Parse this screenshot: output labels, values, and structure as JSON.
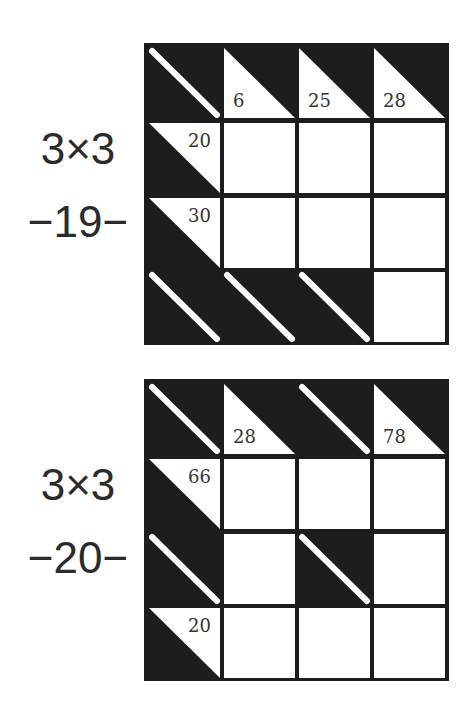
{
  "puzzles": [
    {
      "size_label": "3×3",
      "number_label": "−19−",
      "grid": [
        [
          {
            "type": "block"
          },
          {
            "type": "down",
            "clue": "6"
          },
          {
            "type": "down",
            "clue": "25"
          },
          {
            "type": "down",
            "clue": "28"
          }
        ],
        [
          {
            "type": "across",
            "clue": "20"
          },
          {
            "type": "white",
            "value": ""
          },
          {
            "type": "white",
            "value": ""
          },
          {
            "type": "white",
            "value": ""
          }
        ],
        [
          {
            "type": "across",
            "clue": "30"
          },
          {
            "type": "white",
            "value": ""
          },
          {
            "type": "white",
            "value": ""
          },
          {
            "type": "white",
            "value": ""
          }
        ],
        [
          {
            "type": "block"
          },
          {
            "type": "block"
          },
          {
            "type": "block"
          },
          {
            "type": "white",
            "value": ""
          }
        ]
      ]
    },
    {
      "size_label": "3×3",
      "number_label": "−20−",
      "grid": [
        [
          {
            "type": "block"
          },
          {
            "type": "down",
            "clue": "28"
          },
          {
            "type": "block"
          },
          {
            "type": "down",
            "clue": "78"
          }
        ],
        [
          {
            "type": "across",
            "clue": "66"
          },
          {
            "type": "white",
            "value": ""
          },
          {
            "type": "white",
            "value": ""
          },
          {
            "type": "white",
            "value": ""
          }
        ],
        [
          {
            "type": "block"
          },
          {
            "type": "white",
            "value": ""
          },
          {
            "type": "block"
          },
          {
            "type": "white",
            "value": ""
          }
        ],
        [
          {
            "type": "across",
            "clue": "20"
          },
          {
            "type": "white",
            "value": ""
          },
          {
            "type": "white",
            "value": ""
          },
          {
            "type": "white",
            "value": ""
          }
        ]
      ]
    }
  ],
  "colors": {
    "block": "#1d1d1d",
    "white": "#ffffff",
    "text": "#333333",
    "label": "#2b2b2b"
  }
}
